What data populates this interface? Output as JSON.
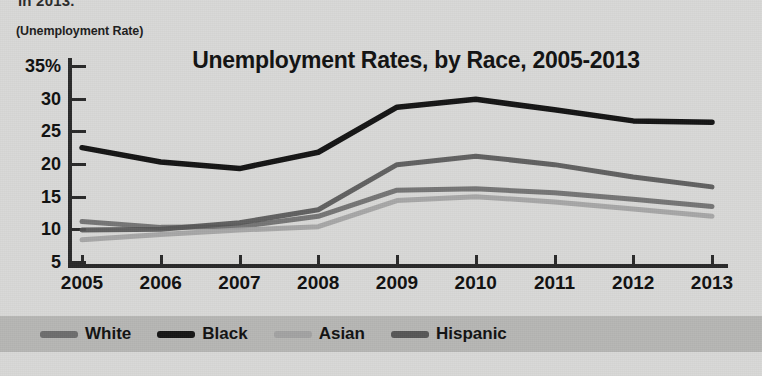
{
  "page": {
    "cut_off_caption": "in 2013.",
    "axis_caption": "(Unemployment Rate)",
    "background_color": "#d9d9d7",
    "legend_band_color": "#b6b6b4"
  },
  "chart_data": {
    "type": "line",
    "title": "Unemployment Rates, by Race, 2005-2013",
    "xlabel": "",
    "ylabel": "(Unemployment Rate)",
    "categories": [
      "2005",
      "2006",
      "2007",
      "2008",
      "2009",
      "2010",
      "2011",
      "2012",
      "2013"
    ],
    "x": [
      2005,
      2006,
      2007,
      2008,
      2009,
      2010,
      2011,
      2012,
      2013
    ],
    "ylim": [
      5,
      35
    ],
    "xlim": [
      2005,
      2013
    ],
    "yticks": [
      5,
      10,
      15,
      20,
      25,
      30,
      35
    ],
    "ytick_labels": [
      "5",
      "10",
      "15",
      "20",
      "25",
      "30",
      "35%"
    ],
    "grid": false,
    "legend_position": "bottom",
    "series": [
      {
        "name": "White",
        "color": "#6e6e6e",
        "values": [
          11.2,
          10.3,
          10.4,
          12.0,
          16.0,
          16.2,
          15.6,
          14.6,
          13.5
        ]
      },
      {
        "name": "Black",
        "color": "#151515",
        "values": [
          22.5,
          20.3,
          19.3,
          21.8,
          28.7,
          29.9,
          28.3,
          26.6,
          26.4
        ]
      },
      {
        "name": "Asian",
        "color": "#a3a3a3",
        "values": [
          8.4,
          9.2,
          9.9,
          10.4,
          14.4,
          15.0,
          14.2,
          13.1,
          12.0
        ]
      },
      {
        "name": "Hispanic",
        "color": "#575757",
        "values": [
          9.9,
          10.0,
          11.0,
          13.0,
          19.9,
          21.2,
          19.9,
          18.0,
          16.5
        ]
      }
    ]
  },
  "legend": {
    "items": [
      {
        "label": "White",
        "color": "#6e6e6e"
      },
      {
        "label": "Black",
        "color": "#151515"
      },
      {
        "label": "Asian",
        "color": "#a3a3a3"
      },
      {
        "label": "Hispanic",
        "color": "#575757"
      }
    ]
  }
}
